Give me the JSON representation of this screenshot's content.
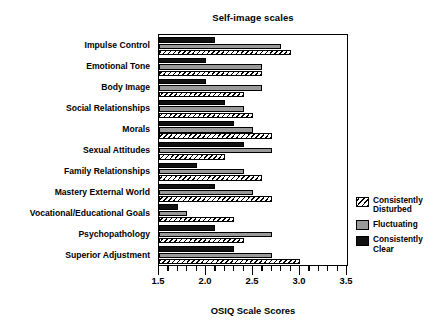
{
  "chart_data": {
    "type": "bar",
    "orientation": "horizontal",
    "title": "Self-image scales",
    "xlabel": "OSIQ Scale Scores",
    "ylabel": "",
    "xlim": [
      1.5,
      3.5
    ],
    "grid": false,
    "legend_position": "right",
    "xticks": [
      1.5,
      2.0,
      2.5,
      3.0,
      3.5
    ],
    "xticklabels": [
      "1.5",
      "2.0",
      "2.5",
      "3.0",
      "3.5"
    ],
    "minor_tick_step": 0.1,
    "categories": [
      "Impulse Control",
      "Emotional Tone",
      "Body Image",
      "Social Relationships",
      "Morals",
      "Sexual Attitudes",
      "Family Relationships",
      "Mastery External World",
      "Vocational/Educational Goals",
      "Psychopathology",
      "Superior Adjustment"
    ],
    "series": [
      {
        "name": "Consistently Disturbed",
        "style": "hatched",
        "color": "#000000",
        "values": [
          2.9,
          2.6,
          2.4,
          2.5,
          2.7,
          2.2,
          2.6,
          2.7,
          2.3,
          2.4,
          3.0
        ]
      },
      {
        "name": "Fluctuating",
        "style": "gray",
        "color": "#9a9a9a",
        "values": [
          2.8,
          2.6,
          2.6,
          2.4,
          2.5,
          2.7,
          2.4,
          2.5,
          1.8,
          2.7,
          2.7
        ]
      },
      {
        "name": "Consistently Clear",
        "style": "black",
        "color": "#111111",
        "values": [
          2.1,
          2.0,
          2.0,
          2.2,
          2.3,
          2.4,
          1.9,
          2.1,
          1.7,
          2.1,
          2.3
        ]
      }
    ]
  },
  "legend": {
    "items": [
      {
        "label": "Consistently\nDisturbed",
        "swatch": "disturb"
      },
      {
        "label": "Fluctuating",
        "swatch": "fluct"
      },
      {
        "label": "Consistently\nClear",
        "swatch": "clear"
      }
    ]
  }
}
